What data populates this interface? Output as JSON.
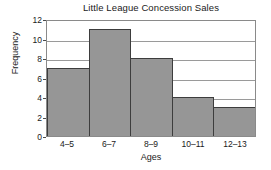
{
  "chart_data": {
    "type": "bar",
    "title": "Little League Concession Sales",
    "xlabel": "Ages",
    "ylabel": "Frequency",
    "categories": [
      "4–5",
      "6–7",
      "8–9",
      "10–11",
      "12–13"
    ],
    "values": [
      7,
      11,
      8,
      4,
      3
    ],
    "ylim": [
      0,
      12
    ],
    "yticks": [
      0,
      2,
      4,
      6,
      8,
      10,
      12
    ],
    "ytick_labels": [
      "0",
      "2",
      "4",
      "6",
      "8",
      "10",
      "12"
    ],
    "grid": "horizontal",
    "legend": "none",
    "colors": {
      "bar_fill": "#969696",
      "bar_edge": "#3d3d3d",
      "gridline": "#9a9a9a",
      "frame": "#8a8a8a",
      "text": "#1a1a1a",
      "background": "#ffffff"
    }
  }
}
